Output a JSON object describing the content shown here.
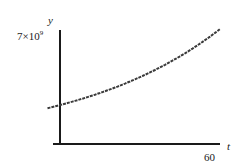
{
  "chart_data": {
    "type": "line",
    "title": "",
    "xlabel": "t",
    "ylabel": "y",
    "x_ticks": [
      60
    ],
    "x_tick_labels": [
      "60"
    ],
    "y_ticks": [
      7000000000
    ],
    "y_tick_labels": [
      "7×10⁹"
    ],
    "xlim": [
      -5,
      64
    ],
    "ylim": [
      0,
      7000000000
    ],
    "grid": false,
    "legend": null,
    "series": [
      {
        "name": "y(t)",
        "style": "dashed-dark",
        "x": [
          -5,
          0,
          10,
          20,
          30,
          40,
          50,
          60,
          64
        ],
        "values": [
          2300000000,
          2500000000,
          2960000000,
          3500000000,
          4150000000,
          4900000000,
          5800000000,
          6900000000,
          7200000000
        ]
      }
    ]
  },
  "labels": {
    "y_axis": "y",
    "x_axis": "t",
    "y_top": "7×10",
    "y_top_exp": "9",
    "x_end": "60"
  },
  "colors": {
    "axis": "#1a1a1a",
    "curve": "#3a3a3a",
    "background": "#ffffff"
  }
}
